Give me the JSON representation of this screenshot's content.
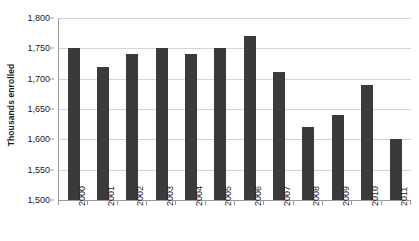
{
  "chart_data": {
    "type": "bar",
    "title": "",
    "subtitle": "",
    "xlabel": "",
    "ylabel": "Thousands enrolled",
    "categories": [
      "2000",
      "2001",
      "2002",
      "2003",
      "2004",
      "2005",
      "2006",
      "2007",
      "2008",
      "2009",
      "2010",
      "2011"
    ],
    "values": [
      1750,
      1720,
      1740,
      1751,
      1740,
      1751,
      1770,
      1711,
      1620,
      1640,
      1690,
      1601
    ],
    "ylim": [
      1500,
      1800
    ],
    "ytick_step": 50,
    "ytick_labels": [
      "1,800",
      "1,750",
      "1,700",
      "1,650",
      "1,600",
      "1,550",
      "1,500"
    ],
    "ytick_values": [
      1800,
      1750,
      1700,
      1650,
      1600,
      1550,
      1500
    ],
    "grid": true,
    "grid_axis": "y",
    "legend": false,
    "legend_position": "none",
    "bar_color": "#3a3a3a",
    "grid_color": "#d4d4d4",
    "axis_color": "#9a9a9a",
    "text_color": "#1a1a1a",
    "background_color": "#ffffff",
    "xtick_label_rotation": -90
  }
}
